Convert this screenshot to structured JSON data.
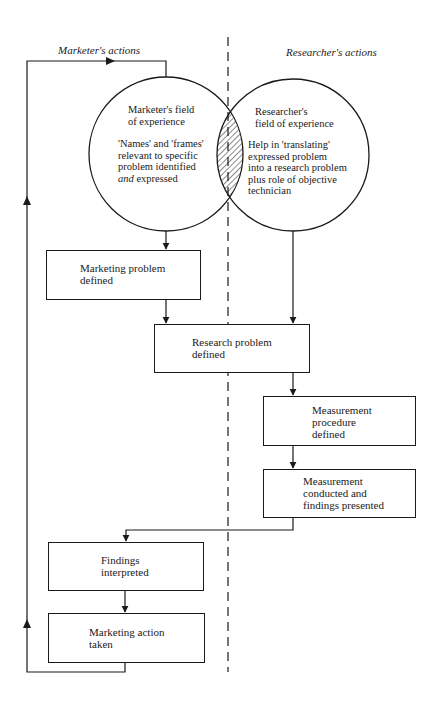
{
  "lanes": {
    "left_label": "Marketer's actions",
    "right_label": "Researcher's actions"
  },
  "circles": {
    "marketer": {
      "title": "Marketer's field\nof experience",
      "body_pre": "'Names' and 'frames'\nrelevant to specific\nproblem identified\n",
      "body_em": "and",
      "body_post": " expressed"
    },
    "researcher": {
      "title": "Researcher's\nfield of experience",
      "body": "Help in 'translating'\nexpressed problem\ninto a research problem\nplus role of objective\ntechnician"
    },
    "overlap_pattern": "diagonal-hatch"
  },
  "boxes": [
    {
      "id": "marketing-problem",
      "text": "Marketing problem\ndefined"
    },
    {
      "id": "research-problem",
      "text": "Research problem\ndefined"
    },
    {
      "id": "measurement-procedure",
      "text": "Measurement\nprocedure\ndefined"
    },
    {
      "id": "measurement-conducted",
      "text": "Measurement\nconducted and\nfindings presented"
    },
    {
      "id": "findings-interpreted",
      "text": "Findings\ninterpreted"
    },
    {
      "id": "marketing-action",
      "text": "Marketing action\ntaken"
    }
  ],
  "colors": {
    "line": "#1a1a1a",
    "background": "#ffffff"
  }
}
